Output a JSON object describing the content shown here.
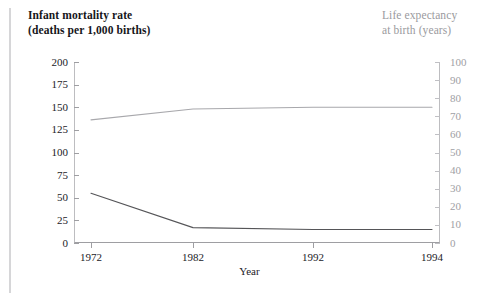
{
  "figure": {
    "background_color": "#ffffff",
    "left_rule_color": "#d6d6d8"
  },
  "titles": {
    "left": "Infant mortality rate\n(deaths per 1,000 births)",
    "right": "Life expectancy\nat birth (years)"
  },
  "axes": {
    "x_title": "Year",
    "x_ticks": [
      "1972",
      "1982",
      "1992",
      "1994"
    ],
    "y_left_ticks": [
      "200",
      "175",
      "150",
      "125",
      "100",
      "75",
      "50",
      "25",
      "0"
    ],
    "y_right_ticks": [
      "100",
      "90",
      "80",
      "70",
      "60",
      "50",
      "40",
      "30",
      "20",
      "10",
      "0"
    ]
  },
  "chart_data": {
    "type": "line",
    "title": "",
    "xlabel": "Year",
    "categories": [
      "1972",
      "1982",
      "1992",
      "1994"
    ],
    "grid": false,
    "legend": "none",
    "series": [
      {
        "name": "Infant mortality rate (deaths per 1,000 births)",
        "axis": "left",
        "color": "#555558",
        "values": [
          55,
          17,
          15,
          15
        ],
        "ylabel": "Infant mortality rate (deaths per 1,000 births)",
        "ylim": [
          0,
          200
        ]
      },
      {
        "name": "Life expectancy at birth (years)",
        "axis": "right",
        "color": "#a8a8ac",
        "values": [
          68,
          74,
          75,
          75
        ],
        "ylabel": "Life expectancy at birth (years)",
        "ylim": [
          0,
          100
        ]
      }
    ]
  }
}
